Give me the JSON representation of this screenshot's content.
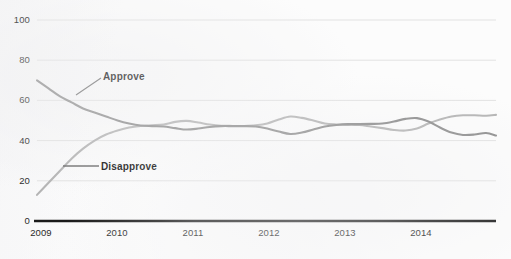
{
  "chart_data": {
    "type": "line",
    "title": "",
    "subtitle": "",
    "xlabel": "",
    "ylabel": "",
    "ylim": [
      0,
      100
    ],
    "xlim": [
      2009.0,
      2014.98
    ],
    "grid": true,
    "legend_position": "inline-annotations",
    "yticks": [
      "0",
      "20",
      "40",
      "60",
      "80",
      "100"
    ],
    "ytick_values": [
      0,
      20,
      40,
      60,
      80,
      100
    ],
    "xticks": [
      "2009",
      "2010",
      "2011",
      "2012",
      "2013",
      "2014"
    ],
    "xtick_values": [
      2009,
      2010,
      2011,
      2012,
      2013,
      2014
    ],
    "colors": {
      "approve": "#8d8d8d",
      "disapprove": "#b4b4b4",
      "axis": "#1a1a1a",
      "grid": "#e2e2e2",
      "text": "#222222"
    },
    "series": [
      {
        "name": "Approve",
        "color": "#8d8d8d",
        "x": [
          2009.0,
          2009.15,
          2009.3,
          2009.45,
          2009.6,
          2009.75,
          2009.9,
          2010.05,
          2010.2,
          2010.35,
          2010.5,
          2010.65,
          2010.8,
          2010.95,
          2011.1,
          2011.25,
          2011.4,
          2011.55,
          2011.7,
          2011.85,
          2012.0,
          2012.15,
          2012.3,
          2012.45,
          2012.6,
          2012.75,
          2012.9,
          2013.05,
          2013.2,
          2013.35,
          2013.5,
          2013.65,
          2013.8,
          2013.95,
          2014.1,
          2014.25,
          2014.4,
          2014.55,
          2014.7,
          2014.85,
          2014.98
        ],
        "y": [
          70.0,
          66.0,
          62.0,
          59.0,
          56.0,
          54.0,
          52.0,
          50.0,
          48.5,
          47.5,
          47.2,
          47.0,
          46.2,
          45.5,
          46.0,
          46.8,
          47.2,
          47.2,
          47.2,
          47.0,
          46.0,
          44.5,
          43.3,
          44.0,
          45.5,
          47.0,
          47.8,
          48.2,
          48.2,
          48.3,
          48.5,
          49.5,
          50.8,
          51.2,
          49.5,
          46.5,
          44.0,
          42.8,
          43.0,
          43.8,
          42.5
        ]
      },
      {
        "name": "Disapprove",
        "color": "#b4b4b4",
        "x": [
          2009.0,
          2009.15,
          2009.3,
          2009.45,
          2009.6,
          2009.75,
          2009.9,
          2010.05,
          2010.2,
          2010.35,
          2010.5,
          2010.65,
          2010.8,
          2010.95,
          2011.1,
          2011.25,
          2011.4,
          2011.55,
          2011.7,
          2011.85,
          2012.0,
          2012.15,
          2012.3,
          2012.45,
          2012.6,
          2012.75,
          2012.9,
          2013.05,
          2013.2,
          2013.35,
          2013.5,
          2013.65,
          2013.8,
          2013.95,
          2014.1,
          2014.25,
          2014.4,
          2014.55,
          2014.7,
          2014.85,
          2014.98
        ],
        "y": [
          13.0,
          19.0,
          25.0,
          31.0,
          36.0,
          40.0,
          43.0,
          45.0,
          46.5,
          47.3,
          47.6,
          48.0,
          49.3,
          49.8,
          49.0,
          48.0,
          47.4,
          47.3,
          47.3,
          47.6,
          48.5,
          50.5,
          52.0,
          51.3,
          50.0,
          48.5,
          48.0,
          47.8,
          47.8,
          47.0,
          46.2,
          45.3,
          45.0,
          46.0,
          48.5,
          50.5,
          52.0,
          52.6,
          52.6,
          52.4,
          52.8
        ]
      }
    ],
    "annotations": [
      {
        "text": "Approve",
        "series": "Approve",
        "leader": "diagonal",
        "x_px": 103,
        "y_px": 76
      },
      {
        "text": "Disapprove",
        "series": "Disapprove",
        "leader": "horizontal",
        "x_px": 101,
        "y_px": 166
      }
    ]
  }
}
